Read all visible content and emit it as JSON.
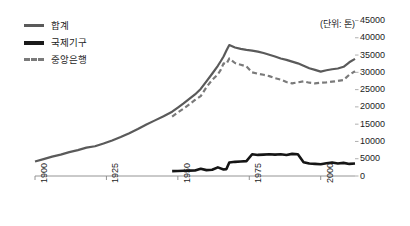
{
  "chart_data": {
    "type": "line",
    "title": "",
    "subtitle": "",
    "unit_note": "(단위: 톤)",
    "xlabel": "",
    "ylabel": "",
    "xlim": [
      1900,
      2012
    ],
    "ylim": [
      0,
      45000
    ],
    "grid": false,
    "legend_position": "top-left",
    "x_ticks": [
      "1900",
      "1925",
      "1950",
      "1975",
      "2000"
    ],
    "x_tick_values": [
      1900,
      1925,
      1950,
      1975,
      2000
    ],
    "y_ticks": [
      "0",
      "5000",
      "10000",
      "15000",
      "20000",
      "25000",
      "30000",
      "35000",
      "40000",
      "45000"
    ],
    "y_tick_values": [
      0,
      5000,
      10000,
      15000,
      20000,
      25000,
      30000,
      35000,
      40000,
      45000
    ],
    "series": [
      {
        "name": "합계",
        "color": "#5a5a5a",
        "style": "solid",
        "width": 2.2,
        "x": [
          1900,
          1903,
          1906,
          1909,
          1912,
          1915,
          1918,
          1921,
          1924,
          1927,
          1930,
          1933,
          1936,
          1939,
          1942,
          1945,
          1948,
          1950,
          1952,
          1954,
          1956,
          1958,
          1960,
          1962,
          1964,
          1965,
          1966,
          1967,
          1968,
          1970,
          1972,
          1974,
          1976,
          1978,
          1980,
          1982,
          1984,
          1986,
          1988,
          1990,
          1992,
          1994,
          1996,
          1998,
          2000,
          2002,
          2004,
          2006,
          2008,
          2010,
          2012
        ],
        "y": [
          4200,
          4900,
          5600,
          6200,
          6900,
          7500,
          8200,
          8600,
          9400,
          10300,
          11300,
          12400,
          13600,
          14900,
          16100,
          17300,
          18600,
          19800,
          21000,
          22300,
          23600,
          25200,
          27400,
          29600,
          31900,
          33200,
          34600,
          36300,
          37900,
          37200,
          36800,
          36500,
          36300,
          36000,
          35600,
          35100,
          34600,
          34000,
          33600,
          33100,
          32600,
          31900,
          31200,
          30700,
          30200,
          30600,
          30900,
          31100,
          31600,
          32900,
          33900
        ]
      },
      {
        "name": "국제기구",
        "color": "#151515",
        "style": "solid",
        "width": 2.6,
        "x": [
          1948,
          1950,
          1952,
          1954,
          1956,
          1958,
          1960,
          1962,
          1964,
          1966,
          1967,
          1968,
          1970,
          1972,
          1974,
          1976,
          1978,
          1980,
          1982,
          1984,
          1986,
          1988,
          1990,
          1992,
          1994,
          1996,
          1998,
          2000,
          2002,
          2004,
          2006,
          2008,
          2010,
          2012
        ],
        "y": [
          1400,
          1450,
          1500,
          1550,
          1600,
          2100,
          1700,
          1800,
          2500,
          1900,
          2000,
          3900,
          4100,
          4200,
          4300,
          6300,
          6100,
          6200,
          6300,
          6200,
          6300,
          6100,
          6400,
          6300,
          4000,
          3600,
          3500,
          3400,
          3700,
          3900,
          3600,
          3800,
          3500,
          3600
        ]
      },
      {
        "name": "중앙은행",
        "color": "#7a7a7a",
        "style": "dashed",
        "width": 2.2,
        "x": [
          1948,
          1950,
          1952,
          1954,
          1956,
          1958,
          1960,
          1962,
          1964,
          1965,
          1966,
          1967,
          1968,
          1970,
          1972,
          1974,
          1976,
          1978,
          1980,
          1982,
          1984,
          1986,
          1988,
          1990,
          1992,
          1994,
          1996,
          1998,
          2000,
          2002,
          2004,
          2006,
          2008,
          2010,
          2012
        ],
        "y": [
          17200,
          18400,
          19500,
          20700,
          22000,
          23100,
          25700,
          27800,
          29400,
          30700,
          32600,
          32400,
          34000,
          32700,
          32200,
          31700,
          30000,
          29600,
          29300,
          28900,
          28300,
          27900,
          27200,
          26800,
          27100,
          27400,
          27000,
          26800,
          27000,
          27100,
          27300,
          27500,
          27800,
          29300,
          30300
        ]
      }
    ]
  }
}
